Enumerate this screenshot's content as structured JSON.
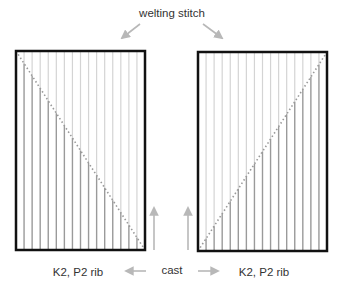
{
  "diagram": {
    "title_label": "welting stitch",
    "left_panel": {
      "name": "left",
      "bottom_label": "K2, P2 rib",
      "diagonal": "top-left to bottom-right",
      "stripe_count": 15
    },
    "right_panel": {
      "name": "right",
      "bottom_label": "K2, P2 rib",
      "diagonal": "bottom-left to top-right",
      "stripe_count": 15
    },
    "center_label": "cast",
    "colors": {
      "frame": "#111111",
      "stripe_dark": "#9a9a9a",
      "stripe_light": "#d4d4d4",
      "diagonal": "#9a9a9a",
      "arrow": "#b8b8b8",
      "text": "#333333"
    }
  }
}
